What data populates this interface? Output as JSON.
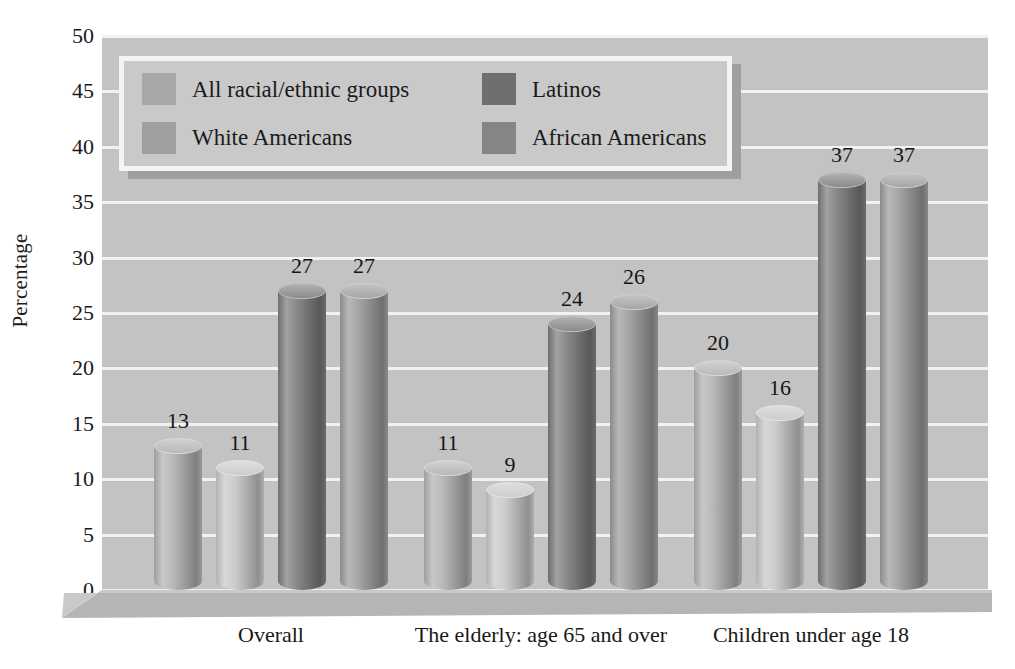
{
  "chart_data": {
    "type": "bar",
    "title": "",
    "subtitle": "",
    "xlabel": "",
    "ylabel": "Percentage",
    "ylim": [
      0,
      50
    ],
    "ytick_step": 5,
    "yticks": [
      50,
      45,
      40,
      35,
      30,
      25,
      20,
      15,
      10,
      5,
      0
    ],
    "grid": true,
    "legend_position": "top-left-inside",
    "categories": [
      "Overall",
      "The elderly: age 65 and over",
      "Children under age 18"
    ],
    "series": [
      {
        "name": "All racial/ethnic groups",
        "values": [
          13,
          11,
          20
        ],
        "color": "#b0b0b0"
      },
      {
        "name": "White Americans",
        "values": [
          11,
          9,
          16
        ],
        "color": "#c6c6c6"
      },
      {
        "name": "Latinos",
        "values": [
          27,
          24,
          37
        ],
        "color": "#7a7a7a"
      },
      {
        "name": "African Americans",
        "values": [
          27,
          26,
          37
        ],
        "color": "#9a9a9a"
      }
    ],
    "data_labels": [
      [
        13,
        11,
        27,
        27
      ],
      [
        11,
        9,
        24,
        26
      ],
      [
        20,
        16,
        37,
        37
      ]
    ],
    "style": {
      "bar_style": "3d-cylinder",
      "plot_background": "#c3c3c3",
      "gridline_color": "#f2f2f2",
      "page_background": "#ffffff",
      "text_color": "#1a1a1a",
      "legend_background": "#c9c9c9",
      "legend_border": "#f4f4f4",
      "legend_shadow": "#9f9f9f",
      "floor_color": "#b5b5b5"
    }
  },
  "legend": {
    "items": [
      {
        "label": "All racial/ethnic groups",
        "swatch": "#a8a8a8"
      },
      {
        "label": "Latinos",
        "swatch": "#6f6f6f"
      },
      {
        "label": "White Americans",
        "swatch": "#a0a0a0"
      },
      {
        "label": "African Americans",
        "swatch": "#858585"
      }
    ]
  }
}
